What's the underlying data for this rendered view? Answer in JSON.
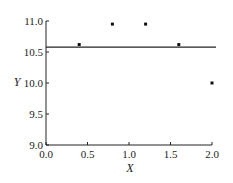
{
  "chart_data": {
    "type": "scatter",
    "title": "",
    "xlabel": "X",
    "ylabel": "Y",
    "xlim": [
      0.0,
      2.0
    ],
    "ylim": [
      9.0,
      11.0
    ],
    "xticks": [
      "0.0",
      "0.5",
      "1.0",
      "1.5",
      "2.0"
    ],
    "yticks": [
      "9.0",
      "9.5",
      "10.0",
      "10.5",
      "11.0"
    ],
    "grid": false,
    "legend": null,
    "series": [
      {
        "name": "points",
        "type": "scatter",
        "x": [
          0.4,
          0.8,
          1.2,
          1.6,
          2.0
        ],
        "y": [
          10.62,
          10.95,
          10.95,
          10.62,
          10.0
        ]
      },
      {
        "name": "mean line",
        "type": "hline",
        "y": 10.58
      }
    ]
  }
}
